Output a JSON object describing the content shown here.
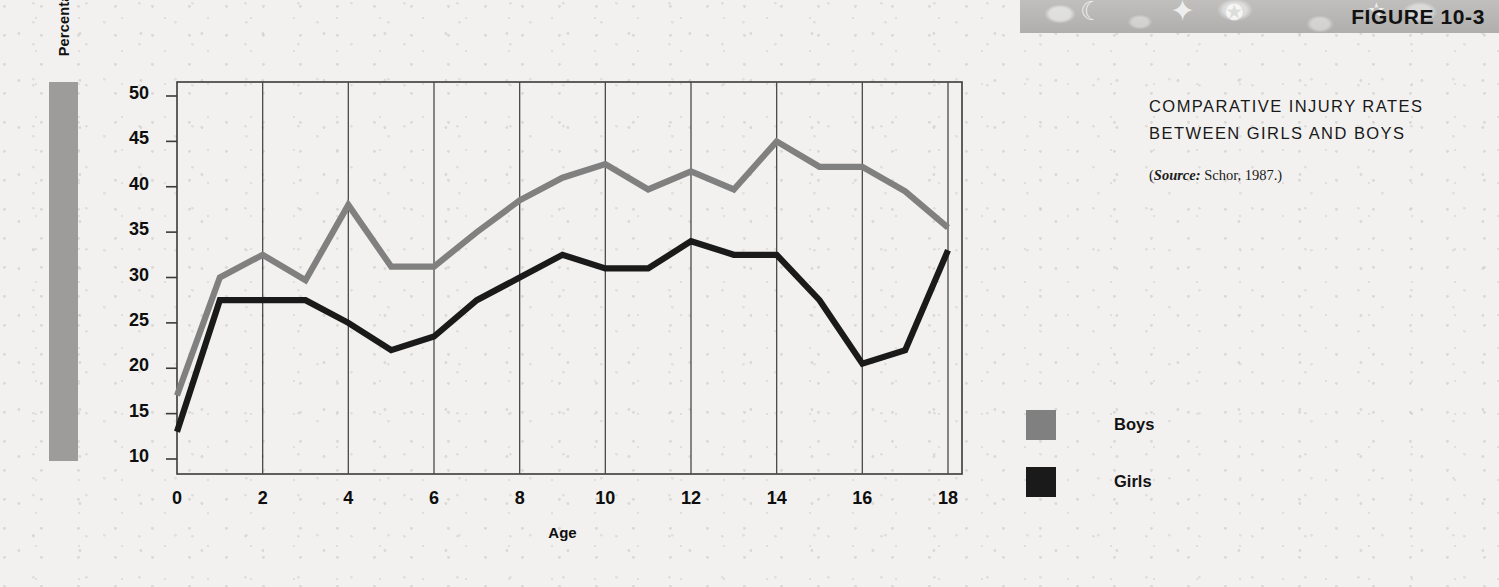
{
  "figure": {
    "label": "FIGURE 10-3",
    "title_line1": "COMPARATIVE INJURY RATES",
    "title_line2": "BETWEEN GIRLS AND BOYS",
    "source_prefix": "(",
    "source_word": "Source:",
    "source_rest": " Schor, 1987.)"
  },
  "colors": {
    "boys": "#808080",
    "girls": "#1a1a1a",
    "axis": "#3a3a3a",
    "gridline": "#4a4a4a",
    "band": "#b9b8b6",
    "ylabel_band": "#9d9c9a",
    "background": "#f2f1ef"
  },
  "legend": {
    "items": [
      {
        "label": "Boys",
        "color": "#808080",
        "swatch": "boys-swatch"
      },
      {
        "label": "Girls",
        "color": "#1a1a1a",
        "swatch": "girls-swatch"
      }
    ]
  },
  "chart_data": {
    "type": "line",
    "title": "COMPARATIVE INJURY RATES BETWEEN GIRLS AND BOYS",
    "xlabel": "Age",
    "ylabel": "Percentage of Patients with Accidents",
    "xlim": [
      0,
      18
    ],
    "ylim": [
      8,
      51
    ],
    "xticks": [
      0,
      2,
      4,
      6,
      8,
      10,
      12,
      14,
      16,
      18
    ],
    "xtick_labels": [
      "0",
      "2",
      "4",
      "6",
      "8",
      "10",
      "12",
      "14",
      "16",
      "18"
    ],
    "yticks": [
      10,
      15,
      20,
      25,
      30,
      35,
      40,
      45,
      50
    ],
    "ytick_labels": [
      "10",
      "15",
      "20",
      "25",
      "30",
      "35",
      "40",
      "45",
      "50"
    ],
    "grid": "vertical-at-even-ages",
    "legend_position": "right",
    "x": [
      0,
      1,
      2,
      3,
      4,
      5,
      6,
      7,
      8,
      9,
      10,
      11,
      12,
      13,
      14,
      15,
      16,
      17,
      18
    ],
    "series": [
      {
        "name": "Boys",
        "color": "#808080",
        "values": [
          17.0,
          30.0,
          32.5,
          29.7,
          38.0,
          31.2,
          31.2,
          35.0,
          38.5,
          41.0,
          42.5,
          39.7,
          41.7,
          39.7,
          45.0,
          42.2,
          42.2,
          39.5,
          35.5
        ]
      },
      {
        "name": "Girls",
        "color": "#1a1a1a",
        "values": [
          13.0,
          27.5,
          27.5,
          27.5,
          25.0,
          22.0,
          23.5,
          27.5,
          30.0,
          32.5,
          31.0,
          31.0,
          34.0,
          32.5,
          32.5,
          27.5,
          20.5,
          22.0,
          33.0
        ]
      }
    ]
  },
  "axis_geometry": {
    "plot_left": 177,
    "plot_right": 962,
    "plot_top": 82,
    "plot_bottom": 474,
    "x_zero_px": 177,
    "x_max_px": 948,
    "y_for_50_px": 96,
    "y_for_10_px": 459
  }
}
